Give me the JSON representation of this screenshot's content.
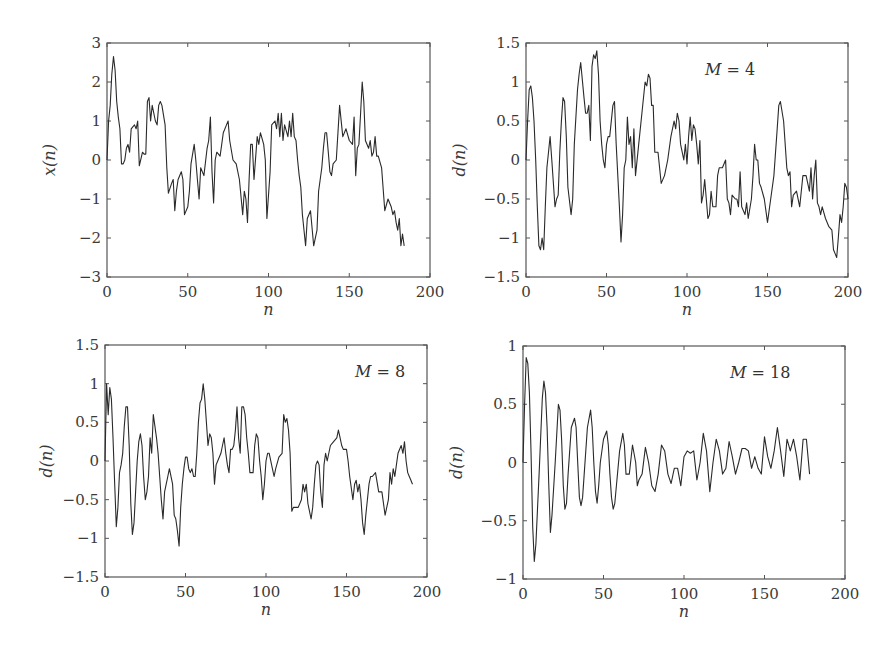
{
  "chart_data": [
    {
      "type": "line",
      "panel": "top-left",
      "title": "",
      "annotation": "",
      "xlabel": "n",
      "ylabel": "x(n)",
      "xlim": [
        0,
        200
      ],
      "ylim": [
        -3,
        3
      ],
      "xticks": [
        "0",
        "50",
        "100",
        "150",
        "200"
      ],
      "yticks": [
        "3",
        "2",
        "1",
        "0",
        "−1",
        "−2",
        "−3"
      ],
      "grid": false,
      "x": [
        0,
        1,
        2,
        3,
        4,
        5,
        6,
        7,
        8,
        9,
        10,
        11,
        12,
        13,
        14,
        15,
        16,
        17,
        18,
        19,
        20,
        22,
        23,
        24,
        25,
        26,
        27,
        28,
        30,
        31,
        32,
        33,
        34,
        36,
        37,
        38,
        40,
        41,
        42,
        43,
        44,
        46,
        47,
        48,
        50,
        51,
        52,
        54,
        55,
        56,
        57,
        58,
        60,
        62,
        63,
        64,
        65,
        66,
        67,
        68,
        70,
        72,
        74,
        75,
        76,
        78,
        80,
        82,
        84,
        85,
        86,
        87,
        88,
        89,
        90,
        91,
        93,
        94,
        95,
        97,
        98,
        99,
        101,
        102,
        104,
        105,
        106,
        107,
        108,
        109,
        110,
        112,
        113,
        114,
        115,
        116,
        117,
        118,
        119,
        120,
        121,
        122,
        123,
        124,
        126,
        128,
        130,
        131,
        132,
        133,
        134,
        135,
        136,
        137,
        138,
        139,
        140,
        142,
        144,
        146,
        148,
        150,
        152,
        153,
        154,
        155,
        156,
        157,
        158,
        159,
        160,
        162,
        163,
        164,
        165,
        166,
        167,
        168,
        170,
        172,
        174,
        176,
        177,
        178,
        179,
        180,
        181,
        182,
        183,
        184,
        185,
        186,
        187,
        188,
        190,
        191,
        192,
        193,
        194,
        195,
        196,
        197,
        198,
        199,
        200
      ],
      "values": [
        0,
        1.0,
        1.4,
        2.2,
        2.65,
        2.3,
        1.5,
        1.1,
        0.8,
        -0.1,
        -0.1,
        0.0,
        0.3,
        0.4,
        0.2,
        0.8,
        0.85,
        0.9,
        0.8,
        1.0,
        -0.15,
        0.2,
        0.15,
        0.15,
        1.5,
        1.6,
        1.0,
        1.4,
        1.0,
        0.9,
        1.4,
        1.5,
        1.4,
        0.9,
        -0.2,
        -0.85,
        -0.6,
        -0.5,
        -1.3,
        -0.8,
        -0.5,
        -0.3,
        -0.5,
        -1.4,
        -1.2,
        -0.8,
        -0.1,
        0.4,
        0.0,
        -0.5,
        -1.0,
        -0.2,
        -0.4,
        0.3,
        0.5,
        1.1,
        -0.3,
        -1.1,
        0.0,
        0.2,
        0.1,
        0.7,
        0.9,
        1.0,
        0.5,
        0.0,
        -0.1,
        -0.5,
        -1.4,
        -0.8,
        -1.0,
        -1.6,
        -0.5,
        0.4,
        0.4,
        -0.5,
        0.6,
        0.4,
        0.7,
        0.4,
        0.0,
        -1.5,
        -0.3,
        0.9,
        1.0,
        0.8,
        1.2,
        0.6,
        1.2,
        0.5,
        0.9,
        0.6,
        1.0,
        0.6,
        1.2,
        0.6,
        0.5,
        0.0,
        -0.4,
        -0.7,
        -1.4,
        -1.8,
        -2.2,
        -1.5,
        -1.3,
        -2.2,
        -1.8,
        -0.8,
        -0.5,
        -0.2,
        0.3,
        0.7,
        0.7,
        0.2,
        -0.3,
        -0.4,
        -0.1,
        0.0,
        1.4,
        0.6,
        0.8,
        0.5,
        0.4,
        1.1,
        -0.4,
        0.3,
        0.4,
        1.2,
        2.0,
        1.5,
        0.5,
        0.3,
        0.5,
        0.1,
        0.2,
        0.6,
        0.1,
        0.1,
        -0.2,
        -1.3,
        -1.0,
        -1.2,
        -1.4,
        -1.3,
        -1.6,
        -1.8,
        -1.5,
        -2.2,
        -1.9,
        -2.2
      ]
    },
    {
      "type": "line",
      "panel": "top-right",
      "title": "",
      "annotation": "M = 4",
      "xlabel": "n",
      "ylabel": "d(n)",
      "xlim": [
        0,
        200
      ],
      "ylim": [
        -1.5,
        1.5
      ],
      "xticks": [
        "0",
        "50",
        "100",
        "150",
        "200"
      ],
      "yticks": [
        "1.5",
        "1",
        "0.5",
        "0",
        "−0.5",
        "−1",
        "−1.5"
      ],
      "grid": false,
      "x": [
        0,
        1,
        2,
        3,
        4,
        5,
        6,
        7,
        8,
        9,
        10,
        11,
        12,
        13,
        14,
        15,
        16,
        18,
        19,
        20,
        21,
        22,
        23,
        24,
        25,
        26,
        28,
        29,
        30,
        32,
        33,
        34,
        36,
        37,
        38,
        39,
        40,
        41,
        42,
        43,
        44,
        45,
        46,
        47,
        48,
        49,
        50,
        51,
        52,
        54,
        55,
        56,
        58,
        59,
        60,
        61,
        62,
        63,
        64,
        65,
        66,
        67,
        68,
        70,
        72,
        74,
        75,
        76,
        77,
        78,
        79,
        80,
        82,
        84,
        86,
        88,
        90,
        92,
        93,
        94,
        95,
        96,
        97,
        98,
        99,
        100,
        101,
        102,
        103,
        104,
        105,
        106,
        107,
        108,
        109,
        110,
        111,
        112,
        113,
        114,
        115,
        116,
        118,
        119,
        120,
        122,
        124,
        125,
        126,
        127,
        128,
        130,
        131,
        132,
        133,
        134,
        136,
        137,
        138,
        140,
        141,
        142,
        143,
        144,
        145,
        146,
        148,
        150,
        152,
        154,
        156,
        157,
        158,
        160,
        162,
        163,
        164,
        165,
        166,
        168,
        170,
        172,
        174,
        176,
        177,
        178,
        179,
        180,
        181,
        182,
        183,
        184,
        186,
        188,
        190,
        191,
        192,
        193,
        194,
        195,
        196,
        197,
        198,
        199,
        200
      ],
      "values": [
        0,
        0.5,
        0.9,
        0.95,
        0.8,
        0.5,
        0.0,
        -0.6,
        -1.1,
        -1.15,
        -1.0,
        -1.15,
        -0.6,
        -0.1,
        0.1,
        0.3,
        0.0,
        -0.6,
        -0.5,
        -0.45,
        0.1,
        0.5,
        0.8,
        0.75,
        0.3,
        -0.35,
        -0.7,
        -0.5,
        0.2,
        0.9,
        1.1,
        1.25,
        0.8,
        0.6,
        0.6,
        0.7,
        0.25,
        1.2,
        1.35,
        1.3,
        1.4,
        1.1,
        0.5,
        0.2,
        0.0,
        -0.1,
        0.2,
        0.3,
        0.3,
        0.7,
        0.75,
        0.2,
        -0.6,
        -1.05,
        -0.7,
        -0.1,
        0.0,
        0.55,
        0.2,
        0.3,
        -0.1,
        0.4,
        -0.2,
        0.2,
        0.6,
        1.0,
        0.95,
        1.1,
        1.05,
        0.7,
        0.7,
        0.1,
        0.1,
        -0.3,
        -0.2,
        0.0,
        0.3,
        0.5,
        0.4,
        0.6,
        0.5,
        0.2,
        0.1,
        0.0,
        0.2,
        -0.05,
        0.3,
        0.55,
        0.25,
        0.45,
        0.4,
        0.2,
        -0.05,
        0.25,
        -0.55,
        -0.45,
        -0.25,
        -0.5,
        -0.75,
        -0.7,
        -0.4,
        -0.6,
        -0.6,
        -0.2,
        -0.1,
        -0.1,
        0.0,
        -0.5,
        -0.55,
        -0.7,
        -0.45,
        -0.5,
        -0.5,
        -0.6,
        -0.15,
        -0.6,
        -0.7,
        -0.55,
        -0.75,
        -0.5,
        -0.2,
        0.2,
        0.0,
        0.0,
        -0.3,
        -0.35,
        -0.5,
        -0.8,
        -0.5,
        -0.2,
        0.4,
        0.7,
        0.75,
        0.5,
        -0.1,
        -0.2,
        -0.15,
        -0.6,
        -0.45,
        -0.4,
        -0.6,
        -0.2,
        -0.2,
        -0.4,
        -0.1,
        -0.5,
        -0.2,
        0.0,
        -0.55,
        -0.6,
        -0.7,
        -0.6,
        -0.75,
        -0.85,
        -0.9,
        -1.15,
        -1.2,
        -1.25,
        -1.0,
        -0.7,
        -0.8,
        -0.6,
        -0.3,
        -0.35,
        -0.5,
        -0.6
      ]
    },
    {
      "type": "line",
      "panel": "bottom-left",
      "title": "",
      "annotation": "M = 8",
      "xlabel": "n",
      "ylabel": "d(n)",
      "xlim": [
        0,
        200
      ],
      "ylim": [
        -1.5,
        1.5
      ],
      "xticks": [
        "0",
        "50",
        "100",
        "150",
        "200"
      ],
      "yticks": [
        "1.5",
        "1",
        "0.5",
        "0",
        "−0.5",
        "−1",
        "−1.5"
      ],
      "grid": false,
      "x": [
        0,
        1,
        2,
        3,
        4,
        5,
        6,
        7,
        8,
        9,
        10,
        11,
        12,
        13,
        14,
        15,
        16,
        17,
        18,
        19,
        20,
        21,
        22,
        23,
        24,
        25,
        26,
        27,
        28,
        29,
        30,
        31,
        32,
        33,
        34,
        35,
        36,
        37,
        38,
        39,
        40,
        42,
        43,
        44,
        45,
        46,
        47,
        48,
        49,
        50,
        51,
        52,
        53,
        54,
        55,
        56,
        57,
        58,
        59,
        60,
        61,
        62,
        63,
        64,
        65,
        66,
        67,
        68,
        69,
        70,
        72,
        73,
        74,
        75,
        76,
        77,
        78,
        79,
        80,
        81,
        82,
        83,
        84,
        85,
        86,
        87,
        88,
        89,
        90,
        92,
        93,
        94,
        95,
        96,
        97,
        98,
        99,
        100,
        101,
        102,
        104,
        105,
        106,
        108,
        110,
        111,
        112,
        113,
        114,
        115,
        116,
        117,
        118,
        120,
        122,
        123,
        124,
        125,
        126,
        128,
        129,
        130,
        131,
        132,
        133,
        134,
        135,
        136,
        137,
        138,
        140,
        142,
        144,
        145,
        146,
        147,
        148,
        150,
        151,
        152,
        154,
        155,
        156,
        157,
        158,
        159,
        160,
        161,
        162,
        163,
        164,
        165,
        166,
        168,
        170,
        172,
        174,
        176,
        177,
        178,
        179,
        180,
        182,
        184,
        185,
        186,
        187,
        188,
        189,
        190,
        191,
        192,
        194,
        196,
        198,
        200
      ],
      "values": [
        0,
        1.0,
        0.6,
        0.95,
        0.8,
        0.3,
        -0.3,
        -0.85,
        -0.6,
        -0.15,
        -0.05,
        0.1,
        0.45,
        0.7,
        0.7,
        0.2,
        -0.55,
        -0.95,
        -0.8,
        -0.4,
        0.0,
        0.25,
        0.35,
        0.2,
        -0.2,
        -0.5,
        -0.4,
        -0.2,
        0.3,
        0.1,
        0.6,
        0.45,
        0.3,
        0.1,
        -0.2,
        -0.5,
        -0.75,
        -0.4,
        -0.3,
        -0.2,
        -0.1,
        -0.3,
        -0.7,
        -0.75,
        -0.9,
        -1.1,
        -0.6,
        -0.3,
        -0.1,
        0.05,
        0.05,
        -0.1,
        -0.15,
        -0.1,
        -0.2,
        -0.2,
        0.1,
        0.5,
        0.75,
        0.8,
        1.0,
        0.8,
        0.5,
        0.2,
        0.35,
        0.3,
        0.1,
        -0.3,
        -0.05,
        0.0,
        0.1,
        0.2,
        0.3,
        0.1,
        -0.05,
        -0.15,
        0.15,
        0.15,
        0.2,
        0.4,
        0.7,
        0.3,
        0.1,
        0.7,
        0.7,
        0.6,
        0.3,
        0.1,
        -0.15,
        -0.15,
        0.2,
        0.35,
        0.3,
        0.0,
        -0.2,
        -0.5,
        -0.3,
        0.0,
        0.1,
        0.1,
        -0.1,
        -0.2,
        -0.1,
        0.05,
        0.1,
        0.6,
        0.5,
        0.55,
        0.4,
        0.1,
        -0.65,
        -0.6,
        -0.6,
        -0.6,
        -0.5,
        -0.3,
        -0.4,
        -0.3,
        -0.55,
        -0.75,
        -0.6,
        -0.3,
        -0.05,
        0.0,
        -0.05,
        -0.4,
        -0.6,
        -0.05,
        0.1,
        0.0,
        0.2,
        0.25,
        0.3,
        0.4,
        0.3,
        0.2,
        0.15,
        0.15,
        0.0,
        -0.2,
        -0.5,
        -0.3,
        -0.25,
        -0.4,
        -0.3,
        -0.5,
        -0.8,
        -0.95,
        -0.7,
        -0.5,
        -0.3,
        -0.2,
        -0.2,
        -0.15,
        -0.4,
        -0.4,
        -0.7,
        -0.5,
        -0.15,
        -0.3,
        -0.1,
        -0.2,
        0.1,
        0.2,
        0.1,
        0.25,
        0.0,
        -0.15,
        -0.2,
        -0.25,
        -0.3
      ]
    },
    {
      "type": "line",
      "panel": "bottom-right",
      "title": "",
      "annotation": "M = 18",
      "xlabel": "n",
      "ylabel": "d(n)",
      "xlim": [
        0,
        200
      ],
      "ylim": [
        -1,
        1
      ],
      "xticks": [
        "0",
        "50",
        "100",
        "150",
        "200"
      ],
      "yticks": [
        "1",
        "0.5",
        "0",
        "−0.5",
        "−1"
      ],
      "grid": false,
      "x": [
        0,
        1,
        2,
        3,
        4,
        5,
        6,
        7,
        8,
        10,
        12,
        13,
        14,
        15,
        16,
        17,
        18,
        20,
        22,
        23,
        24,
        25,
        26,
        27,
        28,
        30,
        32,
        33,
        34,
        35,
        36,
        37,
        38,
        40,
        42,
        43,
        44,
        45,
        46,
        47,
        48,
        50,
        52,
        53,
        54,
        55,
        56,
        57,
        58,
        60,
        62,
        63,
        64,
        66,
        68,
        70,
        71,
        72,
        74,
        76,
        78,
        80,
        82,
        84,
        86,
        88,
        90,
        92,
        94,
        96,
        98,
        100,
        102,
        104,
        106,
        108,
        110,
        112,
        114,
        116,
        118,
        120,
        122,
        124,
        126,
        128,
        130,
        132,
        134,
        136,
        138,
        140,
        142,
        144,
        146,
        148,
        150,
        152,
        154,
        156,
        158,
        160,
        162,
        164,
        166,
        168,
        170,
        172,
        174,
        176,
        178,
        180,
        182,
        184,
        186,
        188,
        190,
        192,
        194,
        196,
        198,
        200
      ],
      "values": [
        0,
        0.5,
        0.9,
        0.85,
        0.6,
        0.1,
        -0.55,
        -0.85,
        -0.7,
        -0.1,
        0.55,
        0.7,
        0.6,
        0.3,
        -0.2,
        -0.6,
        -0.45,
        0.0,
        0.5,
        0.45,
        0.2,
        -0.2,
        -0.4,
        -0.35,
        -0.1,
        0.3,
        0.38,
        0.3,
        0.0,
        -0.3,
        -0.37,
        -0.3,
        -0.1,
        0.3,
        0.45,
        0.3,
        0.0,
        -0.25,
        -0.35,
        -0.2,
        0.0,
        0.2,
        0.27,
        0.15,
        -0.1,
        -0.3,
        -0.4,
        -0.35,
        -0.2,
        0.1,
        0.25,
        0.15,
        -0.1,
        -0.1,
        0.15,
        0.0,
        -0.2,
        -0.15,
        -0.1,
        0.13,
        0.0,
        -0.2,
        -0.25,
        -0.1,
        0.15,
        0.1,
        -0.1,
        -0.18,
        -0.05,
        -0.05,
        -0.2,
        0.05,
        0.1,
        0.08,
        0.1,
        -0.15,
        0.0,
        0.25,
        0.1,
        -0.25,
        0.0,
        0.2,
        0.1,
        -0.1,
        -0.05,
        0.18,
        0.05,
        -0.1,
        0.0,
        0.12,
        0.12,
        0.1,
        -0.05,
        0.05,
        -0.05,
        -0.1,
        0.22,
        0.05,
        -0.05,
        0.1,
        0.3,
        0.1,
        -0.12,
        0.2,
        0.1,
        0.2,
        0.05,
        -0.15,
        0.2,
        0.2,
        -0.1
      ]
    }
  ]
}
